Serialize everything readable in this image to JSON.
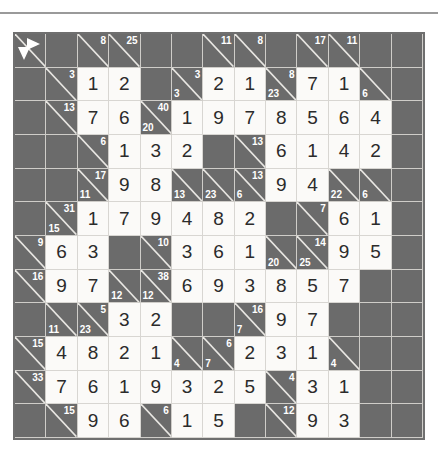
{
  "page": {
    "type": "kakuro-puzzle-grid",
    "columns": 13,
    "rows": 12,
    "colors": {
      "block": "#6b6b6b",
      "white": "#fbfaf8",
      "gridline": "#d8d6d2",
      "border": "#6f6f6f",
      "digit": "#2b2b2b",
      "clue": "#ffffff"
    }
  },
  "legend": {
    "across_arrow": "arrow-right-icon",
    "down_arrow": "arrow-down-icon"
  },
  "grid": {
    "cells": [
      [
        {
          "t": "legend"
        },
        {
          "t": "block"
        },
        {
          "t": "clue",
          "across": "8"
        },
        {
          "t": "clue",
          "across": "25"
        },
        {
          "t": "block"
        },
        {
          "t": "block"
        },
        {
          "t": "clue",
          "across": "11"
        },
        {
          "t": "clue",
          "across": "8"
        },
        {
          "t": "block"
        },
        {
          "t": "clue",
          "across": "17"
        },
        {
          "t": "clue",
          "across": "11"
        },
        {
          "t": "block"
        },
        {
          "t": "block"
        }
      ],
      [
        {
          "t": "block"
        },
        {
          "t": "clue",
          "across": "3"
        },
        {
          "t": "num",
          "v": "1"
        },
        {
          "t": "num",
          "v": "2"
        },
        {
          "t": "block"
        },
        {
          "t": "clue",
          "across": "3",
          "down": "3"
        },
        {
          "t": "num",
          "v": "2"
        },
        {
          "t": "num",
          "v": "1"
        },
        {
          "t": "clue",
          "across": "8",
          "down": "23"
        },
        {
          "t": "num",
          "v": "7"
        },
        {
          "t": "num",
          "v": "1"
        },
        {
          "t": "clue",
          "down": "6"
        },
        {
          "t": "block"
        }
      ],
      [
        {
          "t": "block"
        },
        {
          "t": "clue",
          "across": "13"
        },
        {
          "t": "num",
          "v": "7"
        },
        {
          "t": "num",
          "v": "6"
        },
        {
          "t": "clue",
          "across": "40",
          "down": "20"
        },
        {
          "t": "num",
          "v": "1"
        },
        {
          "t": "num",
          "v": "9"
        },
        {
          "t": "num",
          "v": "7"
        },
        {
          "t": "num",
          "v": "8"
        },
        {
          "t": "num",
          "v": "5"
        },
        {
          "t": "num",
          "v": "6"
        },
        {
          "t": "num",
          "v": "4"
        },
        {
          "t": "block"
        }
      ],
      [
        {
          "t": "block"
        },
        {
          "t": "block"
        },
        {
          "t": "clue",
          "across": "6"
        },
        {
          "t": "num",
          "v": "1"
        },
        {
          "t": "num",
          "v": "3"
        },
        {
          "t": "num",
          "v": "2"
        },
        {
          "t": "block"
        },
        {
          "t": "clue",
          "across": "13"
        },
        {
          "t": "num",
          "v": "6"
        },
        {
          "t": "num",
          "v": "1"
        },
        {
          "t": "num",
          "v": "4"
        },
        {
          "t": "num",
          "v": "2"
        },
        {
          "t": "block"
        }
      ],
      [
        {
          "t": "block"
        },
        {
          "t": "block"
        },
        {
          "t": "clue",
          "across": "17",
          "down": "11"
        },
        {
          "t": "num",
          "v": "9"
        },
        {
          "t": "num",
          "v": "8"
        },
        {
          "t": "clue",
          "down": "13"
        },
        {
          "t": "clue",
          "down": "23"
        },
        {
          "t": "clue",
          "across": "13",
          "down": "6"
        },
        {
          "t": "num",
          "v": "9"
        },
        {
          "t": "num",
          "v": "4"
        },
        {
          "t": "clue",
          "down": "22"
        },
        {
          "t": "clue",
          "down": "6"
        },
        {
          "t": "block"
        }
      ],
      [
        {
          "t": "block"
        },
        {
          "t": "clue",
          "across": "31",
          "down": "15"
        },
        {
          "t": "num",
          "v": "1"
        },
        {
          "t": "num",
          "v": "7"
        },
        {
          "t": "num",
          "v": "9"
        },
        {
          "t": "num",
          "v": "4"
        },
        {
          "t": "num",
          "v": "8"
        },
        {
          "t": "num",
          "v": "2"
        },
        {
          "t": "block"
        },
        {
          "t": "clue",
          "across": "7"
        },
        {
          "t": "num",
          "v": "6"
        },
        {
          "t": "num",
          "v": "1"
        },
        {
          "t": "block"
        }
      ],
      [
        {
          "t": "clue",
          "across": "9"
        },
        {
          "t": "num",
          "v": "6"
        },
        {
          "t": "num",
          "v": "3"
        },
        {
          "t": "block"
        },
        {
          "t": "clue",
          "across": "10"
        },
        {
          "t": "num",
          "v": "3"
        },
        {
          "t": "num",
          "v": "6"
        },
        {
          "t": "num",
          "v": "1"
        },
        {
          "t": "clue",
          "down": "20"
        },
        {
          "t": "clue",
          "across": "14",
          "down": "25"
        },
        {
          "t": "num",
          "v": "9"
        },
        {
          "t": "num",
          "v": "5"
        },
        {
          "t": "block"
        }
      ],
      [
        {
          "t": "clue",
          "across": "16"
        },
        {
          "t": "num",
          "v": "9"
        },
        {
          "t": "num",
          "v": "7"
        },
        {
          "t": "clue",
          "down": "12"
        },
        {
          "t": "clue",
          "across": "38",
          "down": "12"
        },
        {
          "t": "num",
          "v": "6"
        },
        {
          "t": "num",
          "v": "9"
        },
        {
          "t": "num",
          "v": "3"
        },
        {
          "t": "num",
          "v": "8"
        },
        {
          "t": "num",
          "v": "5"
        },
        {
          "t": "num",
          "v": "7"
        },
        {
          "t": "block"
        },
        {
          "t": "block"
        }
      ],
      [
        {
          "t": "block"
        },
        {
          "t": "clue",
          "down": "11"
        },
        {
          "t": "clue",
          "across": "5",
          "down": "23"
        },
        {
          "t": "num",
          "v": "3"
        },
        {
          "t": "num",
          "v": "2"
        },
        {
          "t": "block"
        },
        {
          "t": "block"
        },
        {
          "t": "clue",
          "across": "16",
          "down": "7"
        },
        {
          "t": "num",
          "v": "9"
        },
        {
          "t": "num",
          "v": "7"
        },
        {
          "t": "block"
        },
        {
          "t": "block"
        },
        {
          "t": "block"
        }
      ],
      [
        {
          "t": "clue",
          "across": "15"
        },
        {
          "t": "num",
          "v": "4"
        },
        {
          "t": "num",
          "v": "8"
        },
        {
          "t": "num",
          "v": "2"
        },
        {
          "t": "num",
          "v": "1"
        },
        {
          "t": "clue",
          "down": "4"
        },
        {
          "t": "clue",
          "across": "6",
          "down": "7"
        },
        {
          "t": "num",
          "v": "2"
        },
        {
          "t": "num",
          "v": "3"
        },
        {
          "t": "num",
          "v": "1"
        },
        {
          "t": "clue",
          "down": "4"
        },
        {
          "t": "block"
        },
        {
          "t": "block"
        }
      ],
      [
        {
          "t": "clue",
          "across": "33"
        },
        {
          "t": "num",
          "v": "7"
        },
        {
          "t": "num",
          "v": "6"
        },
        {
          "t": "num",
          "v": "1"
        },
        {
          "t": "num",
          "v": "9"
        },
        {
          "t": "num",
          "v": "3"
        },
        {
          "t": "num",
          "v": "2"
        },
        {
          "t": "num",
          "v": "5"
        },
        {
          "t": "clue",
          "across": "4"
        },
        {
          "t": "num",
          "v": "3"
        },
        {
          "t": "num",
          "v": "1"
        },
        {
          "t": "block"
        },
        {
          "t": "block"
        }
      ],
      [
        {
          "t": "block"
        },
        {
          "t": "clue",
          "across": "15"
        },
        {
          "t": "num",
          "v": "9"
        },
        {
          "t": "num",
          "v": "6"
        },
        {
          "t": "clue",
          "across": "6"
        },
        {
          "t": "num",
          "v": "1"
        },
        {
          "t": "num",
          "v": "5"
        },
        {
          "t": "block"
        },
        {
          "t": "clue",
          "across": "12"
        },
        {
          "t": "num",
          "v": "9"
        },
        {
          "t": "num",
          "v": "3"
        },
        {
          "t": "block"
        },
        {
          "t": "block"
        }
      ]
    ]
  }
}
